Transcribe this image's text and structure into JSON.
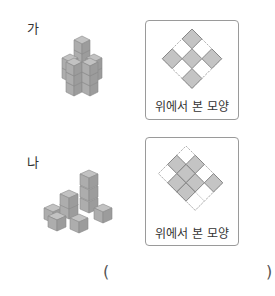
{
  "problems": [
    {
      "label": "가",
      "top_view_caption": "위에서 본 모양",
      "top_view_grid": {
        "rows": 3,
        "cols": 3,
        "filled": [
          [
            0,
            0
          ],
          [
            0,
            2
          ],
          [
            1,
            1
          ],
          [
            2,
            0
          ],
          [
            2,
            2
          ]
        ]
      }
    },
    {
      "label": "나",
      "top_view_caption": "위에서 본 모양",
      "top_view_grid": {
        "rows": 3,
        "cols": 4,
        "filled": [
          [
            0,
            1
          ],
          [
            0,
            3
          ],
          [
            1,
            0
          ],
          [
            1,
            1
          ],
          [
            1,
            2
          ],
          [
            2,
            1
          ],
          [
            2,
            2
          ]
        ]
      }
    }
  ],
  "answer": {
    "open_paren": "(",
    "close_paren": ")",
    "value": ""
  },
  "colors": {
    "cube_top": "#bfbfbf",
    "cube_left": "#a8a8a8",
    "cube_right": "#989898",
    "cell_fill": "#c4c4c4",
    "cell_stroke": "#7a7a7a",
    "dashed": "#9a9a9a",
    "box_border": "#9a9a9a"
  }
}
